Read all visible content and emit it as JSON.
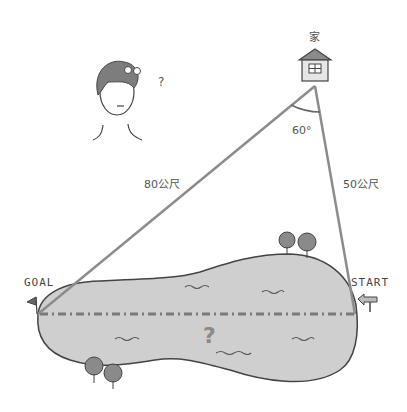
{
  "labels": {
    "house": "家",
    "angle": "60°",
    "side_long": "80公尺",
    "side_short": "50公尺",
    "goal": "GOAL",
    "start": "START",
    "unknown": "?",
    "thinking": "?"
  },
  "colors": {
    "lake_fill": "#cfcfcf",
    "outline": "#444444",
    "line": "#8c8c8c",
    "dash": "#7a7a7a",
    "tree": "#8a8a8a",
    "hair": "#7d7d7d"
  },
  "geometry": {
    "house_vertex": [
      315,
      85
    ],
    "goal_point": [
      38,
      314
    ],
    "start_point": [
      355,
      314
    ],
    "angle_deg": 60
  }
}
